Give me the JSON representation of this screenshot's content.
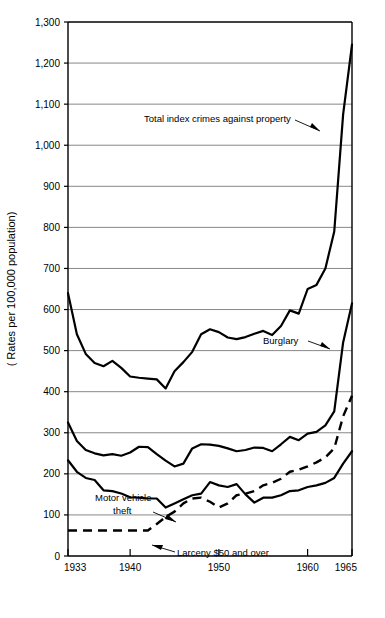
{
  "chart_data": {
    "type": "line",
    "title": "",
    "xlabel": "",
    "ylabel": "( Rates per 100,000 population)",
    "xlim": [
      1933,
      1965
    ],
    "ylim": [
      0,
      1300
    ],
    "grid": true,
    "legend_position": "inline-annotations",
    "x_ticks": [
      1933,
      1940,
      1950,
      1960,
      1965
    ],
    "x_tick_labels": [
      "1933",
      "1940",
      "1950",
      "1960",
      "1965"
    ],
    "y_ticks": [
      0,
      100,
      200,
      300,
      400,
      500,
      600,
      700,
      800,
      900,
      1000,
      1100,
      1200,
      1300
    ],
    "y_tick_labels": [
      "0",
      "100",
      "200",
      "300",
      "400",
      "500",
      "600",
      "700",
      "800",
      "900",
      "1,000",
      "1,100",
      "1,200",
      "1,300"
    ],
    "x": [
      1933,
      1934,
      1935,
      1936,
      1937,
      1938,
      1939,
      1940,
      1941,
      1942,
      1943,
      1944,
      1945,
      1946,
      1947,
      1948,
      1949,
      1950,
      1951,
      1952,
      1953,
      1954,
      1955,
      1956,
      1957,
      1958,
      1959,
      1960,
      1961,
      1962,
      1963,
      1964,
      1965
    ],
    "series": [
      {
        "name": "Total index crimes against property",
        "style": "solid",
        "annotation": "Total index crimes against property",
        "values": [
          640,
          540,
          492,
          470,
          462,
          475,
          458,
          437,
          434,
          432,
          430,
          408,
          450,
          472,
          497,
          540,
          552,
          545,
          532,
          528,
          533,
          541,
          548,
          538,
          560,
          598,
          590,
          650,
          660,
          700,
          790,
          1075,
          1245
        ]
      },
      {
        "name": "Burglary",
        "style": "solid",
        "annotation": "Burglary",
        "values": [
          325,
          280,
          258,
          250,
          245,
          248,
          244,
          252,
          266,
          265,
          248,
          232,
          218,
          225,
          262,
          272,
          271,
          268,
          262,
          255,
          258,
          264,
          263,
          255,
          272,
          290,
          282,
          298,
          302,
          318,
          352,
          520,
          615
        ]
      },
      {
        "name": "Motor vehicle theft",
        "style": "solid",
        "annotation": "Motor vehicle theft",
        "values": [
          233,
          205,
          190,
          185,
          160,
          158,
          152,
          143,
          142,
          140,
          140,
          118,
          128,
          138,
          148,
          152,
          180,
          172,
          168,
          175,
          150,
          130,
          142,
          142,
          148,
          158,
          160,
          168,
          172,
          178,
          190,
          225,
          255
        ]
      },
      {
        "name": "Larceny $50 and over",
        "style": "dashed",
        "annotation": "Larceny $50 and over",
        "values": [
          62,
          62,
          62,
          62,
          62,
          62,
          62,
          62,
          62,
          62,
          78,
          95,
          108,
          128,
          140,
          142,
          132,
          118,
          128,
          148,
          152,
          158,
          172,
          178,
          188,
          205,
          210,
          218,
          228,
          240,
          262,
          340,
          390
        ]
      }
    ]
  },
  "annotations": {
    "total_index": "Total index crimes against property",
    "burglary": "Burglary",
    "motor_vehicle_line1": "Motor vehicle",
    "motor_vehicle_line2": "theft",
    "larceny": "Larceny $50 and over"
  },
  "axis": {
    "ylabel": "( Rates per 100,000 population)"
  }
}
